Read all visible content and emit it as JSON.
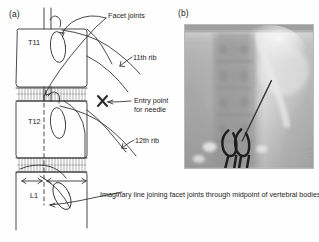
{
  "figure": {
    "domain": "medical-anatomical-figure",
    "panels": [
      {
        "id": "a",
        "label": "(a)",
        "kind": "line-drawing",
        "caption_free": "Lateral line drawing of lower thoracic / upper lumbar spine"
      },
      {
        "id": "b",
        "label": "(b)",
        "kind": "fluoroscopic-radiograph",
        "caption_free": "Antero-posterior fluoroscopic image with needle and biopsy forceps"
      }
    ]
  },
  "panel_a": {
    "label": "(a)",
    "vertebra_labels": [
      {
        "name": "T11",
        "text": "T11"
      },
      {
        "name": "T12",
        "text": "T12"
      },
      {
        "name": "L1",
        "text": "L1"
      }
    ],
    "annotations": [
      {
        "name": "facet-joints",
        "text": "Facet joints"
      },
      {
        "name": "eleventh-rib",
        "text": "11th rib"
      },
      {
        "name": "entry-point",
        "text": "Entry point for needle"
      },
      {
        "name": "twelfth-rib",
        "text": "12th rib"
      },
      {
        "name": "imaginary-line",
        "text": "Imaginary line joining facet joints through midpoint of vertebral bodies"
      }
    ],
    "markers": [
      {
        "name": "needle-entry-cross",
        "glyph": "X"
      }
    ],
    "measurement": {
      "name": "midpoint-width-arrows",
      "style": "double-headed-arrows"
    }
  },
  "panel_b": {
    "label": "(b)",
    "features": [
      {
        "name": "vertebral-bodies"
      },
      {
        "name": "needle-track"
      },
      {
        "name": "biopsy-forceps"
      },
      {
        "name": "psoas-shadow"
      }
    ]
  },
  "colors": {
    "ink": "#1a1a1a",
    "paper": "#fefefe",
    "line": "#2b2b2b",
    "xray_mid": "#c9c9c9",
    "xray_dark": "#7d7d7d",
    "xray_light": "#ededed"
  }
}
